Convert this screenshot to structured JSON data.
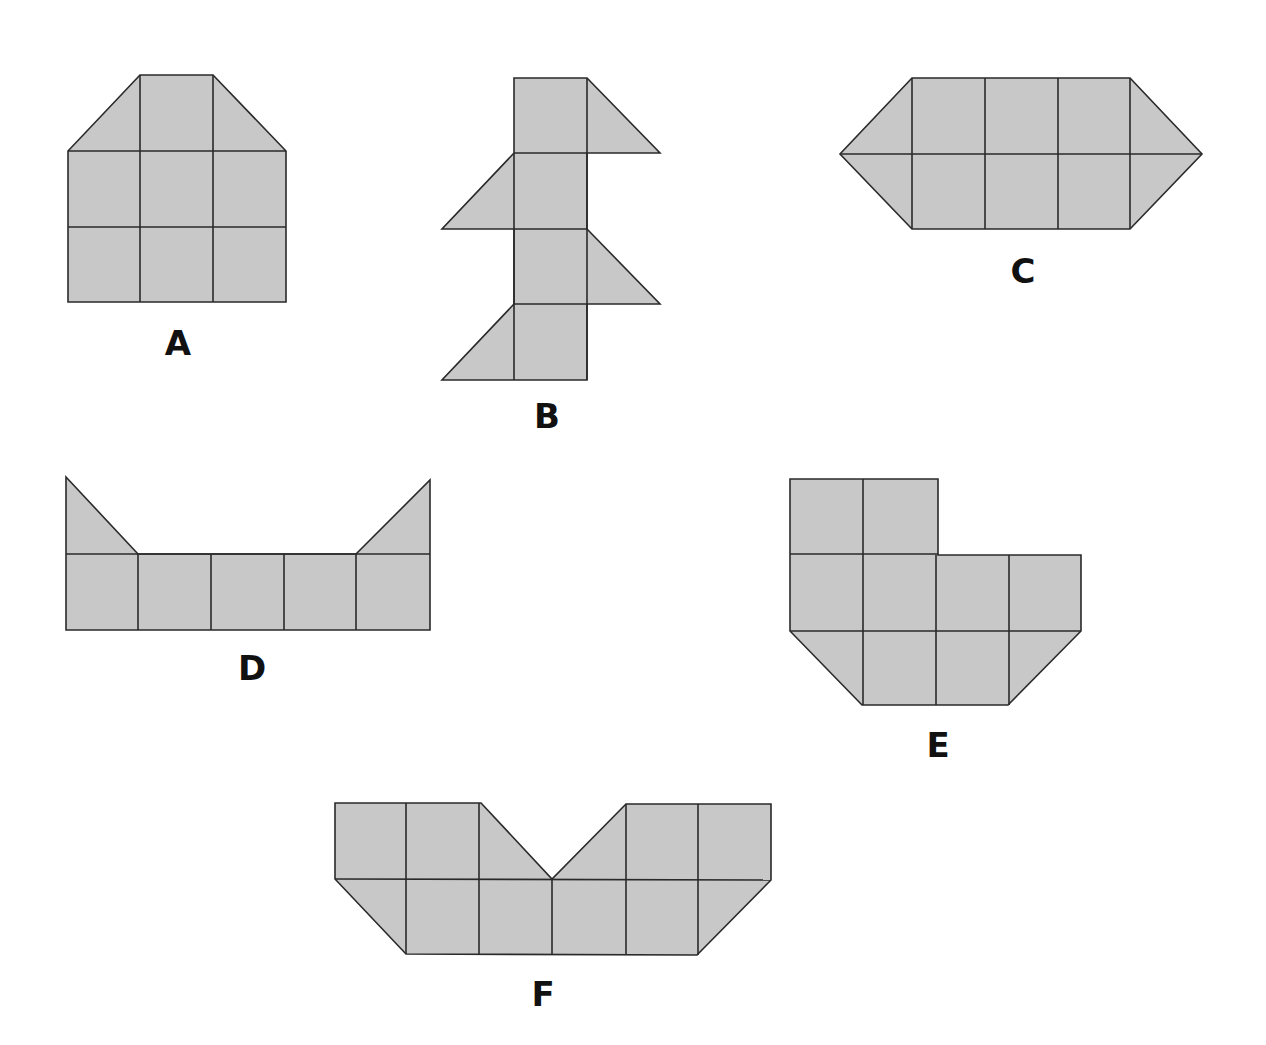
{
  "colors": {
    "fill": "#c8c8c8",
    "stroke": "#2a2a2a",
    "background": "#ffffff"
  },
  "figures": [
    {
      "label": "A",
      "label_pos": [
        178,
        355
      ],
      "outline": [
        [
          140,
          75
        ],
        [
          213,
          75
        ],
        [
          286,
          151
        ],
        [
          286,
          302
        ],
        [
          68,
          302
        ],
        [
          68,
          151
        ]
      ],
      "lines": [
        [
          [
            68,
            151
          ],
          [
            286,
            151
          ]
        ],
        [
          [
            68,
            227
          ],
          [
            286,
            227
          ]
        ],
        [
          [
            140,
            75
          ],
          [
            140,
            302
          ]
        ],
        [
          [
            213,
            75
          ],
          [
            213,
            302
          ]
        ]
      ]
    },
    {
      "label": "B",
      "label_pos": [
        547,
        428
      ],
      "outline": [
        [
          514,
          78
        ],
        [
          587,
          78
        ],
        [
          660,
          153
        ],
        [
          587,
          153
        ],
        [
          587,
          229
        ],
        [
          660,
          304
        ],
        [
          587,
          304
        ],
        [
          587,
          380
        ],
        [
          442,
          380
        ],
        [
          514,
          304
        ],
        [
          514,
          229
        ],
        [
          442,
          229
        ],
        [
          514,
          153
        ]
      ],
      "lines": [
        [
          [
            514,
            153
          ],
          [
            587,
            153
          ]
        ],
        [
          [
            514,
            229
          ],
          [
            587,
            229
          ]
        ],
        [
          [
            514,
            304
          ],
          [
            587,
            304
          ]
        ],
        [
          [
            514,
            153
          ],
          [
            514,
            304
          ]
        ],
        [
          [
            514,
            304
          ],
          [
            514,
            380
          ]
        ],
        [
          [
            587,
            78
          ],
          [
            587,
            380
          ]
        ]
      ]
    },
    {
      "label": "C",
      "label_pos": [
        1023,
        283
      ],
      "outline": [
        [
          912,
          78
        ],
        [
          1130,
          78
        ],
        [
          1202,
          154
        ],
        [
          1130,
          229
        ],
        [
          912,
          229
        ],
        [
          840,
          154
        ]
      ],
      "lines": [
        [
          [
            840,
            154
          ],
          [
            1202,
            154
          ]
        ],
        [
          [
            912,
            78
          ],
          [
            912,
            229
          ]
        ],
        [
          [
            985,
            78
          ],
          [
            985,
            229
          ]
        ],
        [
          [
            1058,
            78
          ],
          [
            1058,
            229
          ]
        ],
        [
          [
            1130,
            78
          ],
          [
            1130,
            229
          ]
        ]
      ]
    },
    {
      "label": "D",
      "label_pos": [
        252,
        680
      ],
      "outline": [
        [
          66,
          477
        ],
        [
          138,
          554
        ],
        [
          356,
          554
        ],
        [
          430,
          480
        ],
        [
          430,
          630
        ],
        [
          66,
          630
        ]
      ],
      "lines": [
        [
          [
            66,
            554
          ],
          [
            430,
            554
          ]
        ],
        [
          [
            138,
            554
          ],
          [
            138,
            630
          ]
        ],
        [
          [
            211,
            554
          ],
          [
            211,
            630
          ]
        ],
        [
          [
            284,
            554
          ],
          [
            284,
            630
          ]
        ],
        [
          [
            356,
            554
          ],
          [
            356,
            630
          ]
        ]
      ]
    },
    {
      "label": "E",
      "label_pos": [
        938,
        757
      ],
      "outline": [
        [
          790,
          479
        ],
        [
          938,
          479
        ],
        [
          938,
          555
        ],
        [
          1081,
          555
        ],
        [
          1081,
          631
        ],
        [
          1008,
          705
        ],
        [
          862,
          705
        ],
        [
          790,
          631
        ]
      ],
      "lines": [
        [
          [
            790,
            554
          ],
          [
            938,
            554
          ]
        ],
        [
          [
            790,
            631
          ],
          [
            1081,
            631
          ]
        ],
        [
          [
            863,
            479
          ],
          [
            863,
            705
          ]
        ],
        [
          [
            936,
            555
          ],
          [
            936,
            705
          ]
        ],
        [
          [
            1009,
            555
          ],
          [
            1009,
            705
          ]
        ]
      ]
    },
    {
      "label": "F",
      "label_pos": [
        543,
        1006
      ],
      "outline": [
        [
          335,
          803
        ],
        [
          481,
          803
        ],
        [
          552,
          879
        ],
        [
          626,
          804
        ],
        [
          771,
          804
        ],
        [
          771,
          880
        ],
        [
          697,
          955
        ],
        [
          406,
          954
        ],
        [
          335,
          879
        ]
      ],
      "lines": [
        [
          [
            335,
            879
          ],
          [
            771,
            880
          ]
        ],
        [
          [
            406,
            803
          ],
          [
            406,
            954
          ]
        ],
        [
          [
            479,
            803
          ],
          [
            479,
            954
          ]
        ],
        [
          [
            552,
            879
          ],
          [
            552,
            955
          ]
        ],
        [
          [
            626,
            804
          ],
          [
            626,
            955
          ]
        ],
        [
          [
            698,
            804
          ],
          [
            698,
            955
          ]
        ]
      ]
    }
  ]
}
